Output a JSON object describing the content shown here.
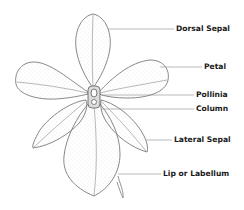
{
  "diagram": {
    "labels": [
      {
        "id": "dorsal-sepal",
        "text": "Dorsal Sepal",
        "x": 176,
        "y": 25
      },
      {
        "id": "petal",
        "text": "Petal",
        "x": 204,
        "y": 62
      },
      {
        "id": "pollinia",
        "text": "Pollinia",
        "x": 196,
        "y": 91
      },
      {
        "id": "column",
        "text": "Column",
        "x": 196,
        "y": 104
      },
      {
        "id": "lateral-sepal",
        "text": "Lateral Sepal",
        "x": 174,
        "y": 136
      },
      {
        "id": "lip-or-labellum",
        "text": "Lip or Labellum",
        "x": 163,
        "y": 170
      }
    ],
    "colors": {
      "line": "#7a7a7a",
      "leader": "#8a8a8a",
      "text": "#1a1a1a",
      "background": "#ffffff"
    }
  }
}
